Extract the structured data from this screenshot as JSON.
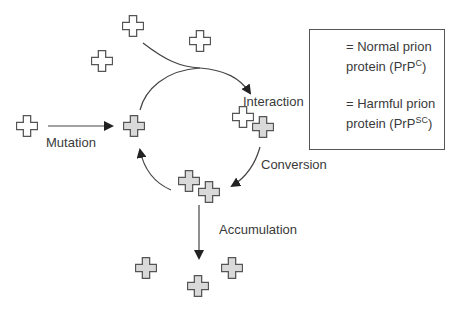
{
  "labels": {
    "interaction": "Interaction",
    "mutation": "Mutation",
    "conversion": "Conversion",
    "accumulation": "Accumulation"
  },
  "legend": {
    "normal": {
      "line1": "= Normal prion",
      "line2": "protein (PrP",
      "sup": "C",
      "close": ")"
    },
    "harmful": {
      "line1": "= Harmful prion",
      "line2": "protein (PrP",
      "sup": "SC",
      "close": ")"
    }
  },
  "colors": {
    "normal_fill": "#ffffff",
    "harmful_fill": "#d9d9d9",
    "stroke": "#555555"
  }
}
